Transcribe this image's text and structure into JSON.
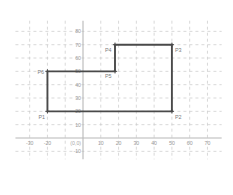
{
  "chart_data": {
    "type": "scatter",
    "title": "",
    "xlabel": "",
    "ylabel": "",
    "xlim": [
      -38,
      78
    ],
    "ylim": [
      -16,
      88
    ],
    "grid": true,
    "grid_step": 10,
    "legend_position": "none",
    "origin_label": "(0,0)",
    "x_ticks": [
      -30,
      -20,
      10,
      20,
      30,
      40,
      50,
      60,
      70
    ],
    "x_tick_labels": [
      "-30",
      "-20",
      "10",
      "20",
      "30",
      "40",
      "50",
      "60",
      "70"
    ],
    "y_ticks": [
      -10,
      10,
      20,
      30,
      40,
      50,
      60,
      70,
      80
    ],
    "y_tick_labels": [
      "-10",
      "10",
      "20",
      "30",
      "40",
      "50",
      "60",
      "70",
      "80"
    ],
    "shape": "closed-polygon-L-shape",
    "points": [
      {
        "name": "P1",
        "x": -20,
        "y": 20,
        "label_dx": -9,
        "label_dy": 8
      },
      {
        "name": "P2",
        "x": 50,
        "y": 20,
        "label_dx": 3,
        "label_dy": 8
      },
      {
        "name": "P3",
        "x": 50,
        "y": 70,
        "label_dx": 3,
        "label_dy": 7
      },
      {
        "name": "P4",
        "x": 18,
        "y": 70,
        "label_dx": -10,
        "label_dy": 7
      },
      {
        "name": "P5",
        "x": 18,
        "y": 50,
        "label_dx": -10,
        "label_dy": 7
      },
      {
        "name": "P6",
        "x": -20,
        "y": 50,
        "label_dx": -10,
        "label_dy": 3
      }
    ],
    "colors": {
      "polygon_stroke": "#4a4a4a",
      "gridline": "#c9c9c9",
      "axis": "#b8b8b8",
      "tick_text": "#9a9a9a",
      "point_label": "#7d7d7d",
      "background": "#ffffff"
    }
  }
}
